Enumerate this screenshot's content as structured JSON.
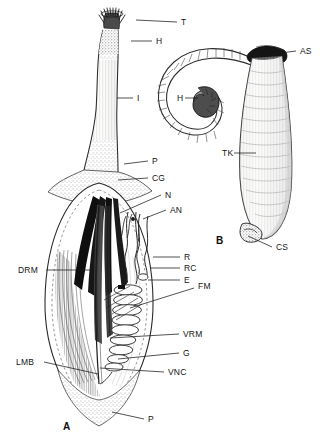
{
  "figure": {
    "kind": "scientific-line-drawing",
    "background_color": "#ffffff",
    "ink_color": "#1a1a1a",
    "panels": [
      {
        "id": "A",
        "caption": "A",
        "x": 63,
        "y": 427,
        "description": "dissected trunk showing internal anatomy"
      },
      {
        "id": "B",
        "caption": "B",
        "x": 216,
        "y": 241,
        "description": "whole animal with coiled introvert"
      }
    ]
  },
  "labels": [
    {
      "key": "T",
      "text": "T",
      "x": 181,
      "y": 22,
      "panel": "A",
      "leader": {
        "x1": 177,
        "y1": 22,
        "x2": 136,
        "y2": 20
      },
      "meaning": "tentacles"
    },
    {
      "key": "H1",
      "text": "H",
      "x": 156,
      "y": 41,
      "panel": "A",
      "leader": {
        "x1": 152,
        "y1": 41,
        "x2": 131,
        "y2": 41
      },
      "meaning": "introvert-hooks"
    },
    {
      "key": "I",
      "text": "I",
      "x": 137,
      "y": 98,
      "panel": "A",
      "leader": {
        "x1": 133,
        "y1": 98,
        "x2": 117,
        "y2": 98
      },
      "meaning": "introvert"
    },
    {
      "key": "P1",
      "text": "P",
      "x": 152,
      "y": 161,
      "panel": "A",
      "leader": {
        "x1": 148,
        "y1": 161,
        "x2": 124,
        "y2": 164
      },
      "meaning": "papillae"
    },
    {
      "key": "CG",
      "text": "CG",
      "x": 152,
      "y": 178,
      "panel": "A",
      "leader": {
        "x1": 148,
        "y1": 178,
        "x2": 118,
        "y2": 180
      },
      "meaning": "cerebral-ganglion"
    },
    {
      "key": "N",
      "text": "N",
      "x": 165,
      "y": 195,
      "panel": "A",
      "leader": {
        "x1": 161,
        "y1": 195,
        "x2": 120,
        "y2": 213
      },
      "meaning": "nephridium"
    },
    {
      "key": "AN",
      "text": "AN",
      "x": 170,
      "y": 210,
      "panel": "A",
      "leader": {
        "x1": 166,
        "y1": 210,
        "x2": 143,
        "y2": 219
      },
      "meaning": "anus"
    },
    {
      "key": "R",
      "text": "R",
      "x": 184,
      "y": 257,
      "panel": "A",
      "leader": {
        "x1": 180,
        "y1": 257,
        "x2": 153,
        "y2": 257
      },
      "meaning": "rectum"
    },
    {
      "key": "RC",
      "text": "RC",
      "x": 184,
      "y": 268,
      "panel": "A",
      "leader": {
        "x1": 180,
        "y1": 268,
        "x2": 150,
        "y2": 268
      },
      "meaning": "rectal-caecum"
    },
    {
      "key": "E",
      "text": "E",
      "x": 184,
      "y": 280,
      "panel": "A",
      "leader": {
        "x1": 180,
        "y1": 280,
        "x2": 148,
        "y2": 280
      },
      "meaning": "esophagus"
    },
    {
      "key": "FM",
      "text": "FM",
      "x": 198,
      "y": 286,
      "panel": "A",
      "leader": {
        "x1": 194,
        "y1": 288,
        "x2": 130,
        "y2": 308
      },
      "meaning": "fixing-muscle"
    },
    {
      "key": "DRM",
      "text": "DRM",
      "x": 18,
      "y": 270,
      "panel": "A",
      "leader": {
        "x1": 46,
        "y1": 270,
        "x2": 90,
        "y2": 270
      },
      "meaning": "dorsal-retractor-muscle"
    },
    {
      "key": "VRM",
      "text": "VRM",
      "x": 183,
      "y": 334,
      "panel": "A",
      "leader": {
        "x1": 179,
        "y1": 334,
        "x2": 110,
        "y2": 338
      },
      "meaning": "ventral-retractor-muscle"
    },
    {
      "key": "G",
      "text": "G",
      "x": 183,
      "y": 353,
      "panel": "A",
      "leader": {
        "x1": 179,
        "y1": 353,
        "x2": 118,
        "y2": 359
      },
      "meaning": "gut"
    },
    {
      "key": "VNC",
      "text": "VNC",
      "x": 168,
      "y": 372,
      "panel": "A",
      "leader": {
        "x1": 164,
        "y1": 372,
        "x2": 100,
        "y2": 368
      },
      "meaning": "ventral-nerve-cord"
    },
    {
      "key": "LMB",
      "text": "LMB",
      "x": 16,
      "y": 362,
      "panel": "A",
      "leader": {
        "x1": 44,
        "y1": 362,
        "x2": 98,
        "y2": 374
      },
      "meaning": "longitudinal-muscle-bands"
    },
    {
      "key": "P2",
      "text": "P",
      "x": 148,
      "y": 419,
      "panel": "A",
      "leader": {
        "x1": 144,
        "y1": 419,
        "x2": 112,
        "y2": 412
      },
      "meaning": "papillae"
    },
    {
      "key": "AS",
      "text": "AS",
      "x": 300,
      "y": 51,
      "panel": "B",
      "leader": {
        "x1": 296,
        "y1": 51,
        "x2": 273,
        "y2": 54
      },
      "meaning": "anal-shields"
    },
    {
      "key": "H2",
      "text": "H",
      "x": 177,
      "y": 98,
      "panel": "B",
      "leader": {
        "x1": 185,
        "y1": 98,
        "x2": 198,
        "y2": 98
      },
      "meaning": "hooks"
    },
    {
      "key": "TK",
      "text": "TK",
      "x": 222,
      "y": 153,
      "panel": "B",
      "leader": {
        "x1": 234,
        "y1": 153,
        "x2": 256,
        "y2": 153
      },
      "meaning": "trunk"
    },
    {
      "key": "CS",
      "text": "CS",
      "x": 276,
      "y": 247,
      "panel": "B",
      "leader": {
        "x1": 272,
        "y1": 247,
        "x2": 248,
        "y2": 236
      },
      "meaning": "caudal-shield"
    }
  ]
}
